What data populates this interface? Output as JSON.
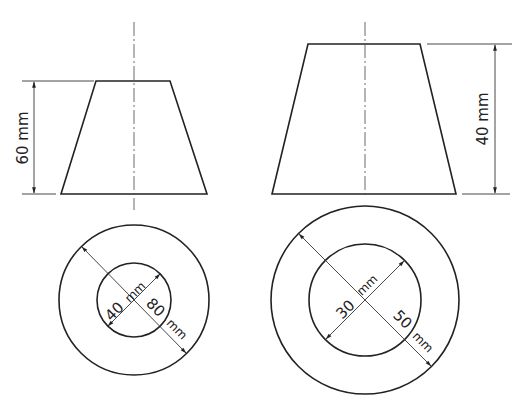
{
  "figure_a": {
    "elevation": {
      "height_label": "60 mm",
      "top": {
        "y": 81,
        "x1": 96,
        "x2": 170
      },
      "bottom": {
        "y": 194,
        "x1": 61,
        "x2": 207
      },
      "center_x": 134
    },
    "plan": {
      "center": [
        134,
        300
      ],
      "outer_r": 75,
      "inner_r": 37,
      "inner_label": "40",
      "inner_unit": "mm",
      "outer_label": "80",
      "outer_unit": "mm"
    }
  },
  "figure_b": {
    "elevation": {
      "height_label": "40 mm",
      "top": {
        "y": 44,
        "x1": 308,
        "x2": 420
      },
      "bottom": {
        "y": 194,
        "x1": 272,
        "x2": 456
      },
      "center_x": 365
    },
    "plan": {
      "center": [
        365,
        300
      ],
      "outer_r": 94,
      "inner_r": 56,
      "inner_label": "30",
      "inner_unit": "mm",
      "outer_label": "50",
      "outer_unit": "mm"
    }
  }
}
